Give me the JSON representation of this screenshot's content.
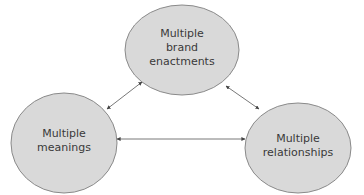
{
  "diagram": {
    "nodes": [
      {
        "id": "brand",
        "lines": [
          "Multiple",
          "brand",
          "enactments"
        ]
      },
      {
        "id": "meanings",
        "lines": [
          "Multiple",
          "meanings"
        ]
      },
      {
        "id": "relationships",
        "lines": [
          "Multiple",
          "relationships"
        ]
      }
    ],
    "edges": [
      {
        "from": "meanings",
        "to": "brand",
        "type": "bidirectional"
      },
      {
        "from": "brand",
        "to": "relationships",
        "type": "bidirectional"
      },
      {
        "from": "meanings",
        "to": "relationships",
        "type": "bidirectional"
      }
    ],
    "colors": {
      "node_fill": "#d9d9d9",
      "node_stroke": "#8a8a8a",
      "edge": "#555555",
      "text": "#3a3a3a"
    }
  }
}
